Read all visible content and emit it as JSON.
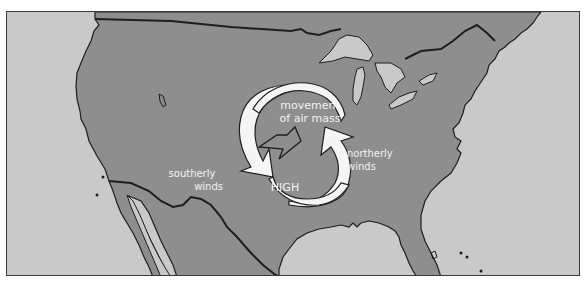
{
  "diagram": {
    "title": "",
    "type": "weather map - high pressure system over North America",
    "labels": {
      "movement_line1": "movement",
      "movement_line2": "of air mass",
      "southerly_line1": "southerly",
      "southerly_line2": "winds",
      "northerly_line1": "northerly",
      "northerly_line2": "winds",
      "high": "HIGH"
    },
    "colors": {
      "land": "#8e8e8e",
      "water": "#c9c9c9",
      "outline": "#1e1e1e",
      "arrow_fill": "#f5f5f5",
      "label_text": "#f2f2f2"
    }
  }
}
